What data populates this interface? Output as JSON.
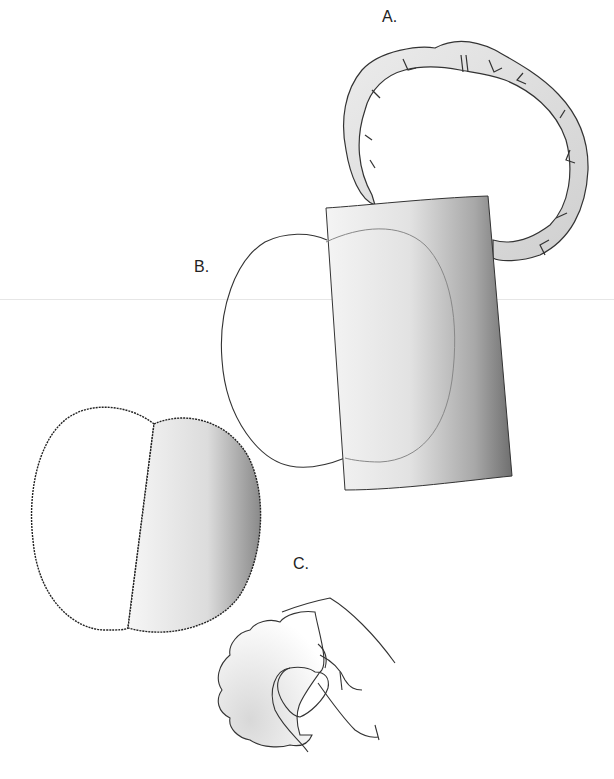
{
  "figure": {
    "panels": [
      {
        "id": "A",
        "label": "A.",
        "description": "ring-shaped folded band with notches"
      },
      {
        "id": "B",
        "label": "B.",
        "description": "oval outline partially covered by shaded rectangular sheet"
      },
      {
        "id": "C",
        "label": "C.",
        "description": "hand pinching a lobed rounded object"
      }
    ],
    "unlabeled": [
      {
        "description": "two-part serrated oval, left half white, right half shaded"
      }
    ],
    "colors": {
      "outline": "#333333",
      "shade_light": "#f2f2f2",
      "shade_dark": "#7a7a7a",
      "rule": "#e6e6e6"
    }
  }
}
